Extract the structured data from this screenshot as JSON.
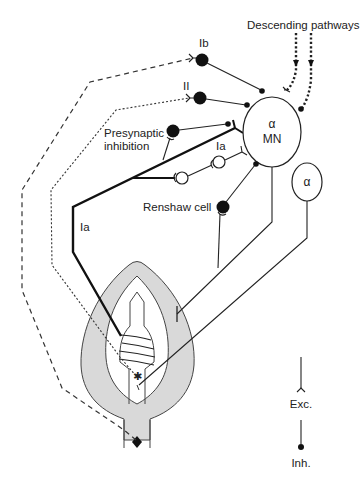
{
  "diagram": {
    "type": "neural circuit schematic (spinal stretch reflex / muscle spindle)",
    "labels": {
      "descending": "Descending pathways",
      "ib": "Ib",
      "ii": "II",
      "presynaptic_line1": "Presynaptic",
      "presynaptic_line2": "inhibition",
      "ia_interneuron": "Ia",
      "ia_afferent": "Ia",
      "renshaw": "Renshaw cell",
      "mn_alpha": "α",
      "mn": "MN",
      "alpha_small": "α"
    },
    "legend": {
      "excitatory": "Exc.",
      "inhibitory": "Inh."
    },
    "colors": {
      "line": "#222222",
      "spindle_capsule": "#d9d9d9",
      "background": "#ffffff"
    }
  }
}
